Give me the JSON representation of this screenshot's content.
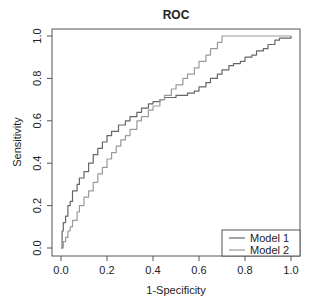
{
  "chart_data": {
    "type": "line",
    "title": "ROC",
    "xlabel": "1-Specificity",
    "ylabel": "Sensitivity",
    "xlim": [
      0,
      1
    ],
    "ylim": [
      0,
      1
    ],
    "grid": false,
    "legend_position": "bottom-right",
    "x_ticks": [
      "0.0",
      "0.2",
      "0.4",
      "0.6",
      "0.8",
      "1.0"
    ],
    "y_ticks": [
      "0.0",
      "0.2",
      "0.4",
      "0.6",
      "0.8",
      "1.0"
    ],
    "series": [
      {
        "name": "Model 1",
        "color": "#666666",
        "points": [
          [
            0,
            0
          ],
          [
            0.005,
            0.08
          ],
          [
            0.01,
            0.12
          ],
          [
            0.02,
            0.15
          ],
          [
            0.03,
            0.2
          ],
          [
            0.04,
            0.22
          ],
          [
            0.05,
            0.27
          ],
          [
            0.07,
            0.3
          ],
          [
            0.08,
            0.33
          ],
          [
            0.1,
            0.36
          ],
          [
            0.12,
            0.4
          ],
          [
            0.14,
            0.44
          ],
          [
            0.16,
            0.47
          ],
          [
            0.18,
            0.5
          ],
          [
            0.2,
            0.53
          ],
          [
            0.22,
            0.55
          ],
          [
            0.25,
            0.58
          ],
          [
            0.28,
            0.6
          ],
          [
            0.3,
            0.62
          ],
          [
            0.33,
            0.64
          ],
          [
            0.35,
            0.66
          ],
          [
            0.38,
            0.68
          ],
          [
            0.4,
            0.69
          ],
          [
            0.43,
            0.7
          ],
          [
            0.45,
            0.71
          ],
          [
            0.5,
            0.72
          ],
          [
            0.55,
            0.73
          ],
          [
            0.58,
            0.74
          ],
          [
            0.6,
            0.76
          ],
          [
            0.63,
            0.78
          ],
          [
            0.65,
            0.8
          ],
          [
            0.68,
            0.82
          ],
          [
            0.7,
            0.84
          ],
          [
            0.73,
            0.86
          ],
          [
            0.75,
            0.87
          ],
          [
            0.78,
            0.88
          ],
          [
            0.8,
            0.9
          ],
          [
            0.83,
            0.91
          ],
          [
            0.85,
            0.93
          ],
          [
            0.88,
            0.94
          ],
          [
            0.9,
            0.96
          ],
          [
            0.93,
            0.98
          ],
          [
            0.95,
            0.99
          ],
          [
            1,
            1
          ]
        ]
      },
      {
        "name": "Model 2",
        "color": "#9a9a9a",
        "points": [
          [
            0,
            0
          ],
          [
            0.01,
            0.03
          ],
          [
            0.02,
            0.05
          ],
          [
            0.03,
            0.08
          ],
          [
            0.04,
            0.1
          ],
          [
            0.05,
            0.13
          ],
          [
            0.07,
            0.17
          ],
          [
            0.08,
            0.2
          ],
          [
            0.1,
            0.24
          ],
          [
            0.12,
            0.27
          ],
          [
            0.14,
            0.31
          ],
          [
            0.16,
            0.35
          ],
          [
            0.18,
            0.38
          ],
          [
            0.2,
            0.42
          ],
          [
            0.22,
            0.45
          ],
          [
            0.24,
            0.48
          ],
          [
            0.26,
            0.51
          ],
          [
            0.28,
            0.53
          ],
          [
            0.3,
            0.56
          ],
          [
            0.33,
            0.6
          ],
          [
            0.35,
            0.62
          ],
          [
            0.38,
            0.65
          ],
          [
            0.4,
            0.67
          ],
          [
            0.43,
            0.7
          ],
          [
            0.45,
            0.72
          ],
          [
            0.48,
            0.75
          ],
          [
            0.5,
            0.77
          ],
          [
            0.53,
            0.8
          ],
          [
            0.55,
            0.82
          ],
          [
            0.58,
            0.85
          ],
          [
            0.6,
            0.88
          ],
          [
            0.63,
            0.91
          ],
          [
            0.65,
            0.94
          ],
          [
            0.68,
            0.97
          ],
          [
            0.7,
            1.0
          ],
          [
            1,
            1
          ]
        ]
      }
    ]
  }
}
